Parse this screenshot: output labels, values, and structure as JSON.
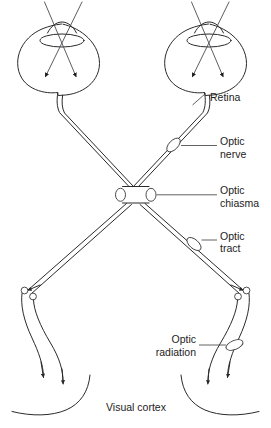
{
  "diagram": {
    "background_color": "#ffffff",
    "stroke_color": "#2a2a2a",
    "ray_color": "#4a4a52",
    "labels": {
      "retina": "Retina",
      "optic_nerve_line1": "Optic",
      "optic_nerve_line2": "nerve",
      "optic_chiasma_line1": "Optic",
      "optic_chiasma_line2": "chiasma",
      "optic_tract_line1": "Optic",
      "optic_tract_line2": "tract",
      "optic_radiation_line1": "Optic",
      "optic_radiation_line2": "radiation",
      "visual_cortex": "Visual cortex"
    },
    "structures": [
      {
        "name": "left-eye",
        "label": ""
      },
      {
        "name": "right-eye",
        "label": "Retina"
      },
      {
        "name": "optic-nerve",
        "label": "Optic nerve"
      },
      {
        "name": "optic-chiasma",
        "label": "Optic chiasma"
      },
      {
        "name": "optic-tract",
        "label": "Optic tract"
      },
      {
        "name": "lateral-geniculate-body",
        "label": ""
      },
      {
        "name": "optic-radiation",
        "label": "Optic radiation"
      },
      {
        "name": "visual-cortex",
        "label": "Visual cortex"
      }
    ]
  }
}
